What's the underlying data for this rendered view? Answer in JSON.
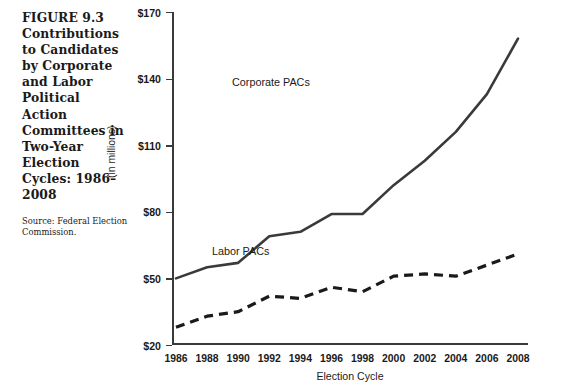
{
  "figure": {
    "caption_title": "FIGURE 9.3 Contributions to Candidates by Corporate and Labor Political Action Committees in Two-Year Election Cycles: 1986–2008",
    "caption_source": "Source: Federal Election Commission."
  },
  "chart_data": {
    "type": "line",
    "title": "Contributions to Candidates by Corporate and Labor Political Action Committees in Two-Year Election Cycles: 1986–2008",
    "xlabel": "Election Cycle",
    "ylabel": "(in millions)",
    "categories": [
      "1986",
      "1988",
      "1990",
      "1992",
      "1994",
      "1996",
      "1998",
      "2000",
      "2002",
      "2004",
      "2006",
      "2008"
    ],
    "ylim": [
      20,
      170
    ],
    "yticks": [
      20,
      50,
      80,
      110,
      140,
      170
    ],
    "ytick_labels": [
      "$20",
      "$50",
      "$80",
      "$110",
      "$140",
      "$170"
    ],
    "grid": false,
    "legend_position": "inline-annotation",
    "series": [
      {
        "name": "Corporate PACs",
        "style": "solid",
        "color": "#3a3a3a",
        "values": [
          50,
          55,
          57,
          69,
          71,
          79,
          79,
          92,
          103,
          116,
          133,
          158
        ]
      },
      {
        "name": "Labor PACs",
        "style": "dashed",
        "color": "#1a1a1a",
        "values": [
          28,
          33,
          35,
          42,
          41,
          46,
          44,
          51,
          52,
          51,
          56,
          61
        ]
      }
    ],
    "annotations": [
      {
        "text": "Corporate PACs",
        "x": "2003",
        "y": 137
      },
      {
        "text": "Labor PACs",
        "x": "2001",
        "y": 68
      }
    ]
  }
}
